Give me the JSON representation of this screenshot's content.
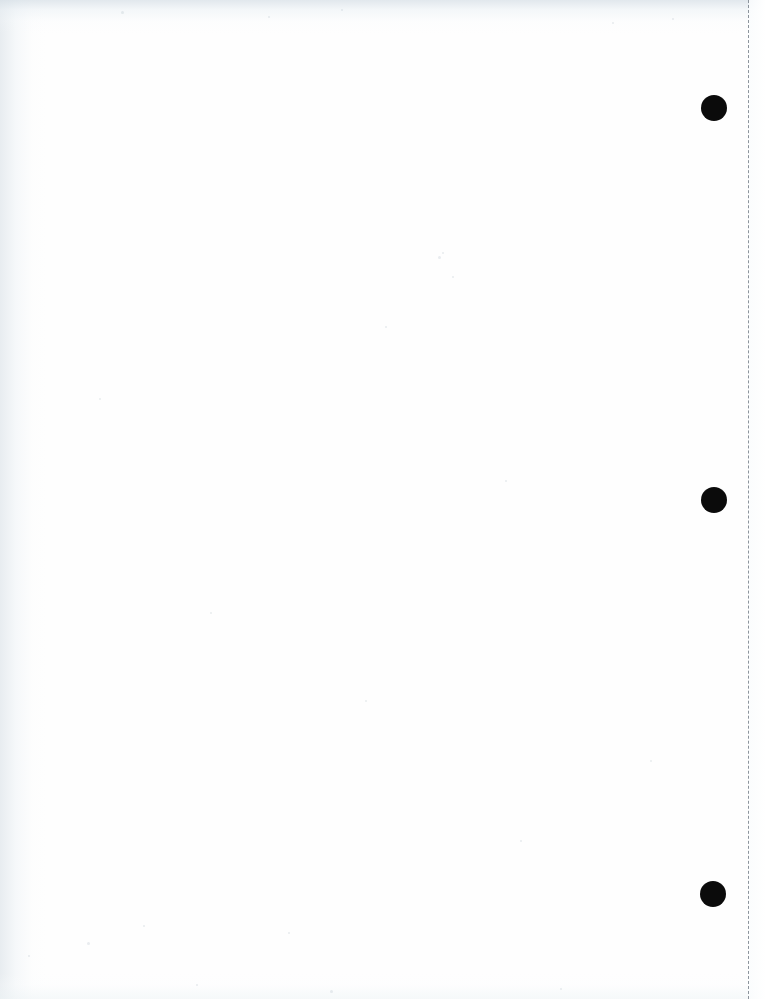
{
  "document": {
    "title": "Scanned Blank Page",
    "page_content": "",
    "page_width": 766,
    "page_height": 999,
    "background_color": "#fefefe",
    "description": "Blank scanned sheet of paper with binding punch marks and a dashed perforation line along the right margin"
  },
  "perforation": {
    "label": "perforation-line",
    "x": 748,
    "color": "#8c949c",
    "width_px": 1.5,
    "dash_length_px": 6,
    "gap_length_px": 5,
    "orientation": "vertical"
  },
  "right_margin_strip": {
    "label": "right-margin-strip",
    "x": 749,
    "width": 17,
    "color": "#fbfdfe"
  },
  "punch_marks": [
    {
      "label": "punch-mark-top",
      "cx": 714,
      "cy": 108,
      "diameter": 26,
      "color": "#0b0b0b"
    },
    {
      "label": "punch-mark-middle",
      "cx": 714,
      "cy": 500,
      "diameter": 26,
      "color": "#0b0b0b"
    },
    {
      "label": "punch-mark-bottom",
      "cx": 713,
      "cy": 894,
      "diameter": 26,
      "color": "#0b0b0b"
    }
  ],
  "scan_artifacts": {
    "left_edge_tint": "#dee5ea",
    "top_edge_tint": "#d6dfe6",
    "bottom_edge_tint": "#eef4f6",
    "speckle_color": "#b0bcc6",
    "speckles": [
      {
        "x": 438,
        "y": 256,
        "size": 3
      },
      {
        "x": 442,
        "y": 252,
        "size": 2
      },
      {
        "x": 385,
        "y": 326,
        "size": 2
      },
      {
        "x": 452,
        "y": 276,
        "size": 2
      },
      {
        "x": 87,
        "y": 942,
        "size": 3
      },
      {
        "x": 28,
        "y": 955,
        "size": 2
      },
      {
        "x": 143,
        "y": 925,
        "size": 2
      },
      {
        "x": 288,
        "y": 932,
        "size": 2
      },
      {
        "x": 330,
        "y": 990,
        "size": 3
      },
      {
        "x": 196,
        "y": 984,
        "size": 2
      },
      {
        "x": 560,
        "y": 988,
        "size": 2
      },
      {
        "x": 268,
        "y": 16,
        "size": 2
      },
      {
        "x": 612,
        "y": 22,
        "size": 2
      },
      {
        "x": 672,
        "y": 18,
        "size": 2
      },
      {
        "x": 121,
        "y": 11,
        "size": 3
      },
      {
        "x": 341,
        "y": 9,
        "size": 2
      },
      {
        "x": 505,
        "y": 480,
        "size": 2
      },
      {
        "x": 210,
        "y": 612,
        "size": 2
      },
      {
        "x": 650,
        "y": 760,
        "size": 2
      },
      {
        "x": 99,
        "y": 398,
        "size": 2
      },
      {
        "x": 520,
        "y": 840,
        "size": 2
      },
      {
        "x": 365,
        "y": 700,
        "size": 2
      }
    ]
  }
}
